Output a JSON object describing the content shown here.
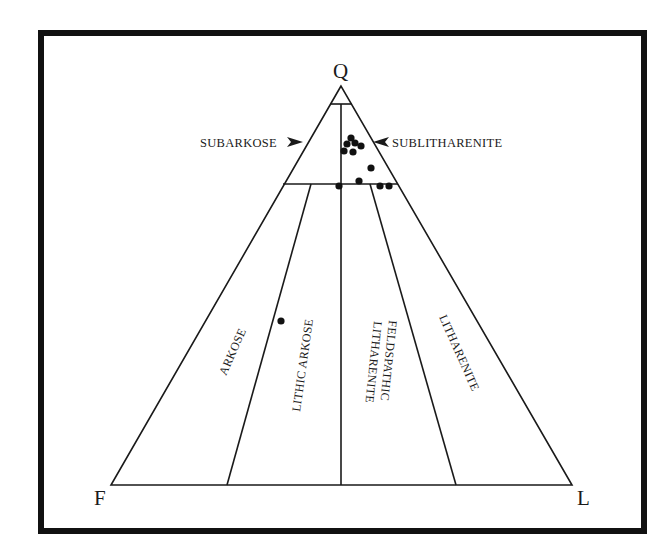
{
  "diagram": {
    "type": "ternary-classification",
    "vertices": {
      "top": "Q",
      "left": "F",
      "right": "L"
    },
    "callouts": {
      "left": "SUBARKOSE",
      "right": "SUBLITHARENITE"
    },
    "fields": {
      "arkose": "ARKOSE",
      "lithic_arkose": "LITHIC ARKOSE",
      "feldspathic_litharenite_1": "FELDSPATHIC",
      "feldspathic_litharenite_2": "LITHARENITE",
      "litharenite": "LITHARENITE"
    },
    "colors": {
      "line": "#1a1a1a",
      "frame": "#111111",
      "background": "#ffffff",
      "points": "#111111"
    },
    "points_px": [
      [
        351,
        138
      ],
      [
        347,
        144
      ],
      [
        355,
        143
      ],
      [
        361,
        146
      ],
      [
        344,
        151
      ],
      [
        353,
        152
      ],
      [
        371,
        168
      ],
      [
        359,
        181
      ],
      [
        339,
        186
      ],
      [
        380,
        186
      ],
      [
        389,
        186
      ],
      [
        281,
        321
      ]
    ]
  }
}
